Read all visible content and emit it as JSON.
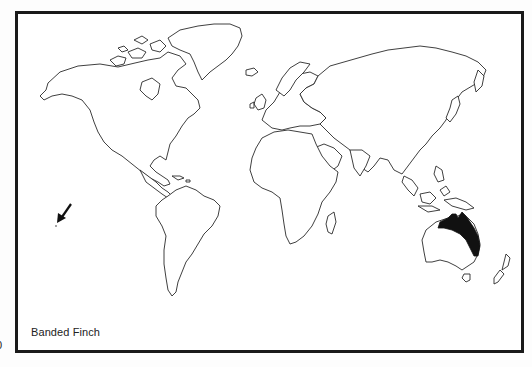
{
  "map": {
    "title": "Banded Finch",
    "type": "world distribution map",
    "edge_mark": "0",
    "highlighted_region": "northern and eastern Australia",
    "arrow_marker": "arrow pointing to Pacific island (lower left)",
    "colors": {
      "border": "#1a1a1a",
      "land_fill": "#ffffff",
      "coastline": "#2a2a2a",
      "range_fill": "#111111"
    }
  }
}
